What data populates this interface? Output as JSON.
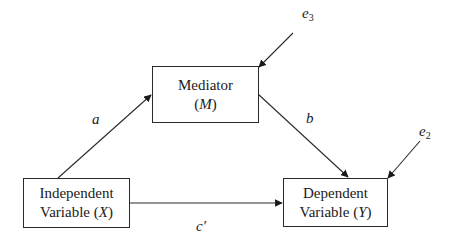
{
  "diagram": {
    "type": "mediation-model",
    "nodes": {
      "mediator": {
        "line1": "Mediator",
        "paren_open": "(",
        "symbol": "M",
        "paren_close": ")"
      },
      "independent": {
        "line1": "Independent",
        "line2_prefix": "Variable (",
        "symbol": "X",
        "paren_close": ")"
      },
      "dependent": {
        "line1": "Dependent",
        "line2_prefix": "Variable (",
        "symbol": "Y",
        "paren_close": ")"
      }
    },
    "paths": {
      "a": "a",
      "b": "b",
      "c_prime": "c′"
    },
    "errors": {
      "e3": {
        "base": "e",
        "sub": "3"
      },
      "e2": {
        "base": "e",
        "sub": "2"
      }
    },
    "edges": [
      {
        "from": "independent",
        "to": "mediator",
        "label": "a"
      },
      {
        "from": "mediator",
        "to": "dependent",
        "label": "b"
      },
      {
        "from": "independent",
        "to": "dependent",
        "label": "c′"
      },
      {
        "from": "e3",
        "to": "mediator"
      },
      {
        "from": "e2",
        "to": "dependent"
      }
    ],
    "colors": {
      "stroke": "#2a2a2a",
      "background": "#ffffff",
      "text": "#1a1a1a"
    }
  }
}
